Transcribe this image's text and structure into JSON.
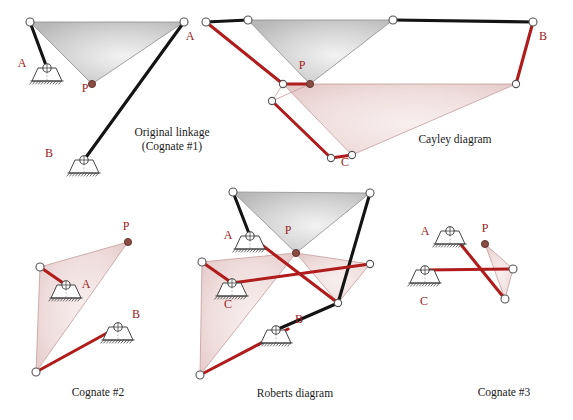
{
  "figure": {
    "title_text": "Roberts-Chebyshev cognate linkages",
    "colors": {
      "red_link": "#b01c1c",
      "red_label": "#9b2222",
      "black_link": "#141414",
      "gray_triangle_fill": "#c9c9c9",
      "pink_triangle_fill": "#e7bfbf",
      "joint_outline": "#555555",
      "joint_fill": "#ffffff",
      "coupler_point_fill": "#8a4b42",
      "ground_outline": "#444444",
      "background": "#ffffff"
    }
  },
  "panels": [
    {
      "id": "original-linkage",
      "caption_lines": [
        "Original linkage",
        "(Cognate #1)"
      ],
      "caption_x": 172,
      "caption_y": 136,
      "labels": [
        {
          "name": "label-A",
          "text": "A",
          "x": 22,
          "y": 67
        },
        {
          "name": "label-P",
          "text": "P",
          "x": 85,
          "y": 92
        },
        {
          "name": "label-B",
          "text": "B",
          "x": 49,
          "y": 157
        }
      ]
    },
    {
      "id": "cayley-diagram",
      "caption_lines": [
        "Cayley diagram"
      ],
      "caption_x": 455,
      "caption_y": 143,
      "labels": [
        {
          "name": "label-A",
          "text": "A",
          "x": 190,
          "y": 40
        },
        {
          "name": "label-B",
          "text": "B",
          "x": 543,
          "y": 40
        },
        {
          "name": "label-P",
          "text": "P",
          "x": 302,
          "y": 69
        },
        {
          "name": "label-C",
          "text": "C",
          "x": 345,
          "y": 166
        }
      ]
    },
    {
      "id": "cognate-2",
      "caption_lines": [
        "Cognate #2"
      ],
      "caption_x": 98,
      "caption_y": 396,
      "labels": [
        {
          "name": "label-P",
          "text": "P",
          "x": 126,
          "y": 230
        },
        {
          "name": "label-A",
          "text": "A",
          "x": 86,
          "y": 288
        },
        {
          "name": "label-B",
          "text": "B",
          "x": 136,
          "y": 318
        }
      ]
    },
    {
      "id": "roberts-diagram",
      "caption_lines": [
        "Roberts diagram"
      ],
      "caption_x": 295,
      "caption_y": 397,
      "labels": [
        {
          "name": "label-A",
          "text": "A",
          "x": 228,
          "y": 239
        },
        {
          "name": "label-P",
          "text": "P",
          "x": 288,
          "y": 234
        },
        {
          "name": "label-C",
          "text": "C",
          "x": 228,
          "y": 308
        },
        {
          "name": "label-B",
          "text": "B",
          "x": 299,
          "y": 323
        }
      ]
    },
    {
      "id": "cognate-3",
      "caption_lines": [
        "Cognate #3"
      ],
      "caption_x": 504,
      "caption_y": 396,
      "labels": [
        {
          "name": "label-A",
          "text": "A",
          "x": 425,
          "y": 235
        },
        {
          "name": "label-P",
          "text": "P",
          "x": 485,
          "y": 232
        },
        {
          "name": "label-C",
          "text": "C",
          "x": 424,
          "y": 305
        }
      ]
    }
  ],
  "geometry": {
    "original": {
      "tri_gray": "30,22 184,22 92,84",
      "black_links": [
        {
          "x1": 30,
          "y1": 22,
          "x2": 47,
          "y2": 68
        },
        {
          "x1": 184,
          "y1": 22,
          "x2": 84,
          "y2": 160
        }
      ],
      "gray_edges": [
        {
          "x1": 30,
          "y1": 22,
          "x2": 184,
          "y2": 22
        },
        {
          "x1": 30,
          "y1": 22,
          "x2": 92,
          "y2": 84
        },
        {
          "x1": 184,
          "y1": 22,
          "x2": 92,
          "y2": 84
        }
      ],
      "joints": [
        {
          "cx": 30,
          "cy": 22,
          "r": 4
        },
        {
          "cx": 184,
          "cy": 22,
          "r": 4
        }
      ],
      "coupler_points": [
        {
          "cx": 92,
          "cy": 84,
          "r": 3.6
        }
      ],
      "grounds": [
        {
          "x": 47,
          "y": 68,
          "rot": 0
        },
        {
          "x": 84,
          "y": 160,
          "rot": 0
        }
      ]
    },
    "cayley": {
      "tri_gray": "248,20 393,20 310,84",
      "tri_pink": "283,84 516,84 352,155",
      "black_links": [
        {
          "x1": 206,
          "y1": 22,
          "x2": 248,
          "y2": 20
        },
        {
          "x1": 393,
          "y1": 20,
          "x2": 533,
          "y2": 22
        }
      ],
      "red_links": [
        {
          "x1": 206,
          "y1": 22,
          "x2": 283,
          "y2": 84
        },
        {
          "x1": 283,
          "y1": 84,
          "x2": 310,
          "y2": 84
        },
        {
          "x1": 272,
          "y1": 101,
          "x2": 331,
          "y2": 158
        },
        {
          "x1": 331,
          "y1": 158,
          "x2": 352,
          "y2": 155
        },
        {
          "x1": 516,
          "y1": 84,
          "x2": 533,
          "y2": 22
        }
      ],
      "pink_edges": [
        {
          "x1": 283,
          "y1": 84,
          "x2": 516,
          "y2": 84
        },
        {
          "x1": 283,
          "y1": 84,
          "x2": 352,
          "y2": 155
        },
        {
          "x1": 516,
          "y1": 84,
          "x2": 352,
          "y2": 155
        },
        {
          "x1": 272,
          "y1": 101,
          "x2": 283,
          "y2": 84
        },
        {
          "x1": 272,
          "y1": 101,
          "x2": 310,
          "y2": 84
        }
      ],
      "gray_edges": [
        {
          "x1": 248,
          "y1": 20,
          "x2": 393,
          "y2": 20
        },
        {
          "x1": 248,
          "y1": 20,
          "x2": 310,
          "y2": 84
        },
        {
          "x1": 393,
          "y1": 20,
          "x2": 310,
          "y2": 84
        }
      ],
      "joints": [
        {
          "cx": 206,
          "cy": 22,
          "r": 4
        },
        {
          "cx": 248,
          "cy": 20,
          "r": 4
        },
        {
          "cx": 393,
          "cy": 20,
          "r": 4
        },
        {
          "cx": 533,
          "cy": 22,
          "r": 4
        },
        {
          "cx": 283,
          "cy": 84,
          "r": 3.6
        },
        {
          "cx": 272,
          "cy": 101,
          "r": 3.6
        },
        {
          "cx": 331,
          "cy": 158,
          "r": 3.6
        },
        {
          "cx": 352,
          "cy": 155,
          "r": 3.6
        },
        {
          "cx": 516,
          "cy": 84,
          "r": 3.6
        }
      ],
      "coupler_points": [
        {
          "cx": 310,
          "cy": 84,
          "r": 3.6
        }
      ]
    },
    "cognate2": {
      "tri_pink": "40,267 128,242 36,372",
      "red_links": [
        {
          "x1": 40,
          "y1": 267,
          "x2": 66,
          "y2": 285
        },
        {
          "x1": 36,
          "y1": 372,
          "x2": 118,
          "y2": 327
        }
      ],
      "pink_edges": [
        {
          "x1": 40,
          "y1": 267,
          "x2": 128,
          "y2": 242
        },
        {
          "x1": 40,
          "y1": 267,
          "x2": 36,
          "y2": 372
        },
        {
          "x1": 128,
          "y1": 242,
          "x2": 36,
          "y2": 372
        }
      ],
      "joints": [
        {
          "cx": 40,
          "cy": 267,
          "r": 4
        },
        {
          "cx": 36,
          "cy": 372,
          "r": 4
        }
      ],
      "coupler_points": [
        {
          "cx": 128,
          "cy": 242,
          "r": 3.6
        }
      ],
      "grounds": [
        {
          "x": 66,
          "y": 285,
          "rot": 0
        },
        {
          "x": 118,
          "y": 327,
          "rot": 0
        }
      ]
    },
    "roberts": {
      "tri_gray": "233,192 370,193 296,253",
      "tri_pink_left": "202,262 296,253 200,375",
      "tri_pink_small": "296,253 338,303 296,253",
      "tri_pink_mid": "296,253 370,264 338,303",
      "black_links": [
        {
          "x1": 233,
          "y1": 192,
          "x2": 250,
          "y2": 236
        },
        {
          "x1": 370,
          "y1": 193,
          "x2": 338,
          "y2": 303
        },
        {
          "x1": 338,
          "y1": 303,
          "x2": 276,
          "y2": 330
        }
      ],
      "red_links": [
        {
          "x1": 202,
          "y1": 262,
          "x2": 232,
          "y2": 283
        },
        {
          "x1": 200,
          "y1": 375,
          "x2": 288,
          "y2": 329
        },
        {
          "x1": 250,
          "y1": 236,
          "x2": 338,
          "y2": 303
        },
        {
          "x1": 232,
          "y1": 283,
          "x2": 370,
          "y2": 264
        }
      ],
      "gray_edges": [
        {
          "x1": 233,
          "y1": 192,
          "x2": 370,
          "y2": 193
        },
        {
          "x1": 233,
          "y1": 192,
          "x2": 296,
          "y2": 253
        },
        {
          "x1": 370,
          "y1": 193,
          "x2": 296,
          "y2": 253
        }
      ],
      "pink_edges": [
        {
          "x1": 202,
          "y1": 262,
          "x2": 296,
          "y2": 253
        },
        {
          "x1": 202,
          "y1": 262,
          "x2": 200,
          "y2": 375
        },
        {
          "x1": 296,
          "y1": 253,
          "x2": 200,
          "y2": 375
        },
        {
          "x1": 296,
          "y1": 253,
          "x2": 370,
          "y2": 264
        },
        {
          "x1": 370,
          "y1": 264,
          "x2": 338,
          "y2": 303
        },
        {
          "x1": 296,
          "y1": 253,
          "x2": 338,
          "y2": 303
        }
      ],
      "joints": [
        {
          "cx": 233,
          "cy": 192,
          "r": 4
        },
        {
          "cx": 370,
          "cy": 193,
          "r": 4
        },
        {
          "cx": 202,
          "cy": 262,
          "r": 4
        },
        {
          "cx": 200,
          "cy": 375,
          "r": 4
        },
        {
          "cx": 370,
          "cy": 264,
          "r": 3.6
        },
        {
          "cx": 338,
          "cy": 303,
          "r": 3.6
        }
      ],
      "coupler_points": [
        {
          "cx": 296,
          "cy": 253,
          "r": 3.6
        }
      ],
      "grounds": [
        {
          "x": 250,
          "y": 236,
          "rot": 0
        },
        {
          "x": 232,
          "y": 283,
          "rot": 0
        },
        {
          "x": 276,
          "y": 330,
          "rot": 0
        }
      ]
    },
    "cognate3": {
      "tri_pink": "485,244 513,269 505,299",
      "red_links": [
        {
          "x1": 450,
          "y1": 231,
          "x2": 505,
          "y2": 299
        },
        {
          "x1": 425,
          "y1": 270,
          "x2": 513,
          "y2": 269
        }
      ],
      "pink_edges": [
        {
          "x1": 485,
          "y1": 244,
          "x2": 513,
          "y2": 269
        },
        {
          "x1": 485,
          "y1": 244,
          "x2": 505,
          "y2": 299
        },
        {
          "x1": 513,
          "y1": 269,
          "x2": 505,
          "y2": 299
        }
      ],
      "joints": [
        {
          "cx": 513,
          "cy": 269,
          "r": 4
        },
        {
          "cx": 505,
          "cy": 299,
          "r": 4
        }
      ],
      "coupler_points": [
        {
          "cx": 485,
          "cy": 244,
          "r": 3.6
        }
      ],
      "grounds": [
        {
          "x": 450,
          "y": 231,
          "rot": 0
        },
        {
          "x": 425,
          "y": 270,
          "rot": 0
        }
      ]
    }
  }
}
